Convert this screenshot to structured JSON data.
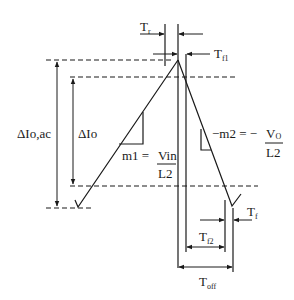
{
  "diagram": {
    "colors": {
      "line": "#1a1a1a",
      "background": "#ffffff"
    },
    "labels": {
      "delta_io_ac": "ΔIo,ac",
      "delta_io": "ΔIo",
      "m1_lhs": "m1 = ",
      "m1_num": "Vin",
      "m1_den": "L2",
      "m2_lhs": "−m2 = −",
      "m2_num": "V",
      "m2_num_sub": "O",
      "m2_den": "L2",
      "tr_main": "T",
      "tr_sub": "r",
      "tf1_main": "T",
      "tf1_sub": "f1",
      "tf_main": "T",
      "tf_sub": "f",
      "tf2_main": "T",
      "tf2_sub": "f2",
      "toff_main": "T",
      "toff_sub": "off"
    }
  }
}
